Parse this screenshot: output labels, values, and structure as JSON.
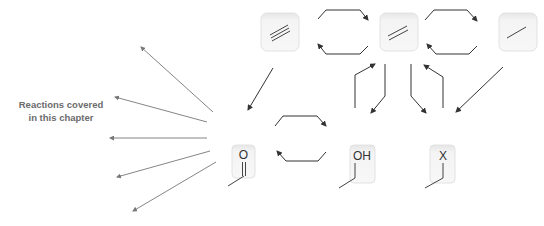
{
  "caption": {
    "line1": "Reactions covered",
    "line2": "in this chapter"
  },
  "molecules": {
    "alkyne": {
      "bond": "triple"
    },
    "alkene": {
      "bond": "double"
    },
    "alkane": {
      "bond": "single"
    },
    "carbonyl": {
      "atom": "O",
      "bond": "double"
    },
    "alcohol": {
      "atom": "OH",
      "bond": "single"
    },
    "halide": {
      "atom": "X",
      "bond": "single"
    }
  },
  "colors": {
    "arrow": "#333333",
    "fan_arrow": "#777777",
    "box_fill": "#f2f2f2",
    "box_stroke": "#dddddd",
    "caption": "#6b6b6b"
  }
}
